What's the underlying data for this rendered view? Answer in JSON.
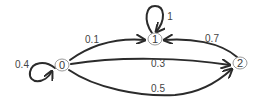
{
  "diagram": {
    "type": "markov-chain-state-diagram",
    "nodes": [
      {
        "id": "0",
        "label": "0"
      },
      {
        "id": "1",
        "label": "1"
      },
      {
        "id": "2",
        "label": "2"
      }
    ],
    "edges": [
      {
        "from": "0",
        "to": "0",
        "label": "0.4"
      },
      {
        "from": "0",
        "to": "1",
        "label": "0.1"
      },
      {
        "from": "0",
        "to": "2",
        "label": "0.3"
      },
      {
        "from": "0",
        "to": "2",
        "label": "0.5"
      },
      {
        "from": "1",
        "to": "1",
        "label": "1"
      },
      {
        "from": "2",
        "to": "1",
        "label": "0.7"
      }
    ],
    "colors": {
      "edge": "#2b2b2b",
      "node_stroke": "#9a9a9a",
      "text": "#3a3a3a"
    }
  }
}
